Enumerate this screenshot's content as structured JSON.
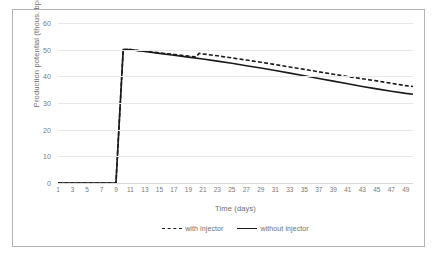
{
  "chart_data": {
    "type": "line",
    "title": "",
    "xlabel": "Time (days)",
    "ylabel": "Production potential (thous. bpd)",
    "xlim": [
      1,
      50
    ],
    "ylim": [
      0,
      60
    ],
    "yticks": [
      0,
      10,
      20,
      30,
      40,
      50,
      60
    ],
    "xticks": [
      1,
      3,
      5,
      7,
      9,
      11,
      13,
      15,
      17,
      19,
      21,
      23,
      25,
      27,
      29,
      31,
      33,
      35,
      37,
      39,
      41,
      43,
      45,
      47,
      49
    ],
    "grid": true,
    "legend_position": "bottom",
    "series": [
      {
        "name": "with injector",
        "style": "dashed",
        "color": "#1a1a1a",
        "x": [
          1,
          2,
          3,
          4,
          5,
          6,
          7,
          8,
          9,
          10,
          11,
          12,
          13,
          14,
          15,
          16,
          17,
          18,
          19,
          20,
          20.5,
          21,
          23,
          25,
          27,
          29,
          31,
          33,
          35,
          37,
          39,
          41,
          43,
          45,
          47,
          49,
          50
        ],
        "y": [
          0,
          0,
          0,
          0,
          0,
          0,
          0,
          0,
          0,
          50,
          50,
          49.7,
          49.4,
          49.1,
          48.8,
          48.5,
          48.2,
          47.9,
          47.6,
          47.3,
          48.6,
          48.4,
          47.7,
          46.9,
          46.1,
          45.3,
          44.4,
          43.5,
          42.6,
          41.7,
          40.8,
          39.9,
          39.1,
          38.3,
          37.4,
          36.5,
          36.2
        ]
      },
      {
        "name": "without injector",
        "style": "solid",
        "color": "#1a1a1a",
        "x": [
          1,
          2,
          3,
          4,
          5,
          6,
          7,
          8,
          9,
          10,
          11,
          13,
          15,
          17,
          19,
          21,
          23,
          25,
          27,
          29,
          31,
          33,
          35,
          37,
          39,
          41,
          43,
          45,
          47,
          49,
          50
        ],
        "y": [
          0,
          0,
          0,
          0,
          0,
          0,
          0,
          0,
          0,
          50,
          50,
          49.3,
          48.6,
          47.9,
          47.2,
          46.5,
          45.7,
          44.9,
          44.0,
          43.1,
          42.2,
          41.2,
          40.2,
          39.2,
          38.2,
          37.2,
          36.2,
          35.3,
          34.4,
          33.6,
          33.3
        ]
      }
    ]
  },
  "legend": {
    "entries": [
      {
        "label": "with injector"
      },
      {
        "label": "without injector"
      }
    ]
  }
}
